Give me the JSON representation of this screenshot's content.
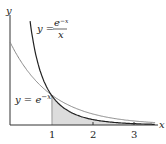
{
  "axes": {
    "x_label": "x",
    "y_label": "y",
    "ticks": [
      "1",
      "2",
      "3"
    ]
  },
  "curves": [
    {
      "name": "exp-over-x",
      "label_lhs": "y =",
      "label_num": "e",
      "label_num_sup": "−x",
      "label_den": "x",
      "color": "#222222"
    },
    {
      "name": "exp",
      "label_lhs": "y = e",
      "label_sup": "−x",
      "color": "#888888"
    }
  ],
  "shaded_region": {
    "from_x": 1,
    "to_x": "∞",
    "under": "e^{-x}/x",
    "color": "#dcdcdc"
  },
  "chart_data": {
    "type": "line",
    "title": "",
    "xlabel": "x",
    "ylabel": "y",
    "xlim": [
      0,
      3.5
    ],
    "ylim": [
      0,
      1.5
    ],
    "series": [
      {
        "name": "y = e^{-x}/x",
        "x": [
          0.25,
          0.5,
          1,
          1.5,
          2,
          2.5,
          3,
          3.5
        ],
        "values": [
          3.115,
          1.213,
          0.368,
          0.149,
          0.068,
          0.033,
          0.017,
          0.009
        ]
      },
      {
        "name": "y = e^{-x}",
        "x": [
          0,
          0.5,
          1,
          1.5,
          2,
          2.5,
          3,
          3.5
        ],
        "values": [
          1,
          0.607,
          0.368,
          0.223,
          0.135,
          0.082,
          0.05,
          0.03
        ]
      }
    ]
  }
}
